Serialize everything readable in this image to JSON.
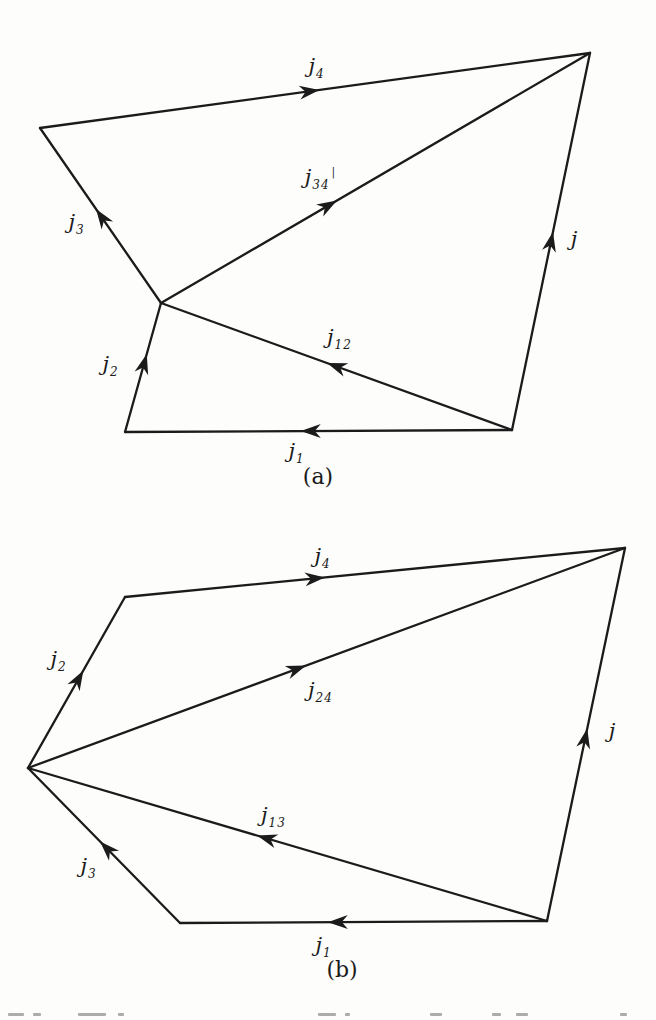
{
  "page": {
    "background": "#fdfdfc",
    "ink": "#1b1b1b",
    "figure_type": "angular-momentum vector coupling polygons"
  },
  "style": {
    "line_width": 2.3,
    "arrow_length": 20,
    "arrow_halfwidth": 7
  },
  "diagrams": [
    {
      "id": "a",
      "caption": "(a)",
      "caption_pos": {
        "x": 318,
        "y": 477
      },
      "vertices": {
        "top_right": {
          "x": 590,
          "y": 53
        },
        "top_left": {
          "x": 40,
          "y": 128
        },
        "junction": {
          "x": 161,
          "y": 303
        },
        "bottom_left": {
          "x": 125,
          "y": 432
        },
        "bottom_right": {
          "x": 512,
          "y": 430
        }
      },
      "edges": [
        {
          "name": "j4",
          "label": "j",
          "sub": "4",
          "suffix": "",
          "from": "top_left",
          "to": "top_right",
          "arrow_t": 0.49,
          "label_x": 316,
          "label_y": 66
        },
        {
          "name": "j34",
          "label": "j",
          "sub": "34",
          "suffix": "|",
          "from": "junction",
          "to": "top_right",
          "arrow_t": 0.39,
          "label_x": 320,
          "label_y": 177
        },
        {
          "name": "j",
          "label": "j",
          "sub": "",
          "suffix": "",
          "from": "bottom_right",
          "to": "top_right",
          "arrow_t": 0.5,
          "label_x": 574,
          "label_y": 239
        },
        {
          "name": "j12",
          "label": "j",
          "sub": "12",
          "suffix": "",
          "from": "bottom_right",
          "to": "junction",
          "arrow_t": 0.5,
          "label_x": 339,
          "label_y": 337
        },
        {
          "name": "j1",
          "label": "j",
          "sub": "1",
          "suffix": "",
          "from": "bottom_right",
          "to": "bottom_left",
          "arrow_t": 0.52,
          "label_x": 296,
          "label_y": 451
        },
        {
          "name": "j2",
          "label": "j",
          "sub": "2",
          "suffix": "",
          "from": "bottom_left",
          "to": "junction",
          "arrow_t": 0.53,
          "label_x": 110,
          "label_y": 364
        },
        {
          "name": "j3",
          "label": "j",
          "sub": "3",
          "suffix": "",
          "from": "junction",
          "to": "top_left",
          "arrow_t": 0.49,
          "label_x": 76,
          "label_y": 222
        }
      ]
    },
    {
      "id": "b",
      "caption": "(b)",
      "caption_pos": {
        "x": 342,
        "y": 970
      },
      "vertices": {
        "top_right": {
          "x": 625,
          "y": 548
        },
        "upper_left": {
          "x": 125,
          "y": 597
        },
        "left_point": {
          "x": 28,
          "y": 768
        },
        "bottom_left": {
          "x": 180,
          "y": 923
        },
        "bottom_right": {
          "x": 547,
          "y": 921
        }
      },
      "edges": [
        {
          "name": "j4",
          "label": "j",
          "sub": "4",
          "suffix": "",
          "from": "upper_left",
          "to": "top_right",
          "arrow_t": 0.38,
          "label_x": 322,
          "label_y": 556
        },
        {
          "name": "j24",
          "label": "j",
          "sub": "24",
          "suffix": "",
          "from": "left_point",
          "to": "top_right",
          "arrow_t": 0.45,
          "label_x": 320,
          "label_y": 690
        },
        {
          "name": "j",
          "label": "j",
          "sub": "",
          "suffix": "",
          "from": "bottom_right",
          "to": "top_right",
          "arrow_t": 0.49,
          "label_x": 612,
          "label_y": 731
        },
        {
          "name": "j13",
          "label": "j",
          "sub": "13",
          "suffix": "",
          "from": "bottom_right",
          "to": "left_point",
          "arrow_t": 0.54,
          "label_x": 273,
          "label_y": 815
        },
        {
          "name": "j1",
          "label": "j",
          "sub": "1",
          "suffix": "",
          "from": "bottom_right",
          "to": "bottom_left",
          "arrow_t": 0.57,
          "label_x": 323,
          "label_y": 945
        },
        {
          "name": "j2",
          "label": "j",
          "sub": "2",
          "suffix": "",
          "from": "left_point",
          "to": "upper_left",
          "arrow_t": 0.52,
          "label_x": 58,
          "label_y": 659
        },
        {
          "name": "j3",
          "label": "j",
          "sub": "3",
          "suffix": "",
          "from": "bottom_left",
          "to": "left_point",
          "arrow_t": 0.48,
          "label_x": 88,
          "label_y": 866
        }
      ]
    }
  ],
  "artifacts": {
    "bottom_fragment_y": 1013,
    "bottom_fragment_dashes": [
      {
        "x": 8,
        "w": 16
      },
      {
        "x": 33,
        "w": 8
      },
      {
        "x": 78,
        "w": 28
      },
      {
        "x": 118,
        "w": 6
      },
      {
        "x": 318,
        "w": 18
      },
      {
        "x": 345,
        "w": 5
      },
      {
        "x": 430,
        "w": 12
      },
      {
        "x": 492,
        "w": 9
      },
      {
        "x": 516,
        "w": 12
      },
      {
        "x": 620,
        "w": 7
      }
    ]
  }
}
